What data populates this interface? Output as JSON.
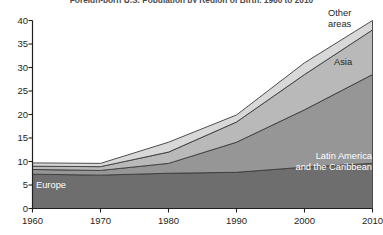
{
  "chart_data": {
    "type": "area",
    "title": "Foreign-born U.S. Population by Region of Birth, 1960 to 2010",
    "xlabel": "",
    "ylabel": "",
    "x": [
      1960,
      1970,
      1980,
      1990,
      2000,
      2010
    ],
    "xtick_labels": [
      "1960",
      "1970",
      "1980",
      "1990",
      "2000",
      "2010"
    ],
    "ytick_labels": [
      "0",
      "5",
      "10",
      "15",
      "20",
      "25",
      "30",
      "35",
      "40"
    ],
    "yticks": [
      0,
      5,
      10,
      15,
      20,
      25,
      30,
      35,
      40
    ],
    "ylim": [
      0,
      40
    ],
    "xlim": [
      1960,
      2010
    ],
    "grid": false,
    "stacked": true,
    "legend_position": "inline-annotations",
    "series": [
      {
        "name": "Europe",
        "label": "Europe",
        "color": "#6e6e6e",
        "label_color": "#ffffff",
        "values": [
          7.3,
          7.1,
          7.5,
          7.7,
          8.8,
          9.6
        ]
      },
      {
        "name": "Latin America and the Caribbean",
        "label": "Latin America\nand the Caribbean",
        "color": "#969696",
        "label_color": "#ffffff",
        "values": [
          1.0,
          1.0,
          2.1,
          6.4,
          12.2,
          18.9
        ]
      },
      {
        "name": "Asia",
        "label": "Asia",
        "color": "#b9b9b9",
        "label_color": "#231f20",
        "values": [
          0.7,
          0.8,
          2.4,
          4.3,
          7.5,
          9.5
        ]
      },
      {
        "name": "Other areas",
        "label": "Other\nareas",
        "color": "#d8d8d8",
        "label_color": "#231f20",
        "values": [
          0.7,
          0.7,
          2.1,
          1.5,
          2.5,
          2.0
        ]
      }
    ],
    "totals": [
      9.7,
      9.6,
      14.1,
      19.9,
      31.0,
      40.0
    ],
    "stack_tops": {
      "europe": [
        7.3,
        7.1,
        7.5,
        7.7,
        8.8,
        9.6
      ],
      "latin_america": [
        8.3,
        8.1,
        9.6,
        14.1,
        21.0,
        28.5
      ],
      "asia": [
        9.0,
        8.9,
        12.0,
        18.4,
        28.5,
        38.0
      ],
      "other": [
        9.7,
        9.6,
        14.1,
        19.9,
        31.0,
        40.0
      ]
    },
    "axis_color": "#231f20",
    "outline_color": "#3b3b3b",
    "background": "#ffffff"
  }
}
